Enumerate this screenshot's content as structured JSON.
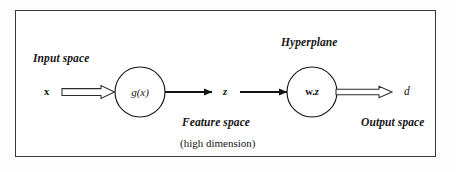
{
  "diagram": {
    "border_color": "#3a3a3a",
    "ink_color": "#151515",
    "background": "#ffffff",
    "captions": {
      "input_space": "Input space",
      "hyperplane": "Hyperplane",
      "feature_space": "Feature space",
      "high_dimension": "(high dimension)",
      "output_space": "Output space"
    },
    "variables": {
      "input": "x",
      "feature": "z",
      "output": "d"
    },
    "nodes": [
      {
        "id": "mapping",
        "label": "g(x)",
        "cx": 140,
        "cy": 92,
        "r": 25
      },
      {
        "id": "hyperplane",
        "label_w": "w",
        "label_sep": ".",
        "label_z": "z",
        "cx": 312,
        "cy": 92,
        "r": 25
      }
    ],
    "arrows": [
      {
        "id": "input-to-mapping",
        "style": "hollow-block",
        "x1": 62,
        "y1": 92,
        "x2": 115,
        "y2": 92
      },
      {
        "id": "mapping-to-feature",
        "style": "solid-line",
        "x1": 165,
        "y1": 92,
        "x2": 213,
        "y2": 92
      },
      {
        "id": "feature-to-hyperplane",
        "style": "solid-line",
        "x1": 240,
        "y1": 92,
        "x2": 288,
        "y2": 92
      },
      {
        "id": "hyperplane-to-output",
        "style": "hollow-block",
        "x1": 337,
        "y1": 92,
        "x2": 392,
        "y2": 92
      }
    ]
  }
}
